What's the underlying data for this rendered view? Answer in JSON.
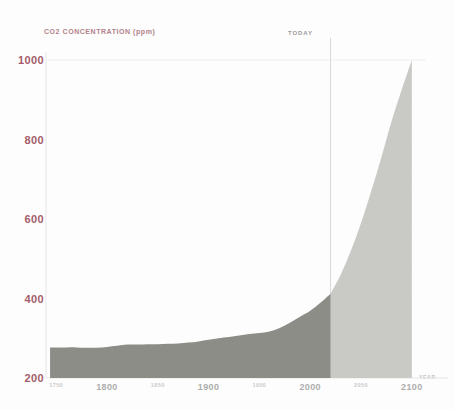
{
  "chart_data": {
    "type": "area",
    "title": "CO2 CONCENTRATION (ppm)",
    "xlabel": "YEAR",
    "ylabel": "CO2 CONCENTRATION (ppm)",
    "xlim": [
      1740,
      2110
    ],
    "ylim": [
      200,
      1000
    ],
    "yticks": [
      200,
      400,
      600,
      800,
      1000
    ],
    "xticks": [
      1750,
      1800,
      1850,
      1900,
      1950,
      2000,
      2050,
      2100
    ],
    "xtick_labels": [
      "1750",
      "1800",
      "1850",
      "1900",
      "1950",
      "2000",
      "2050",
      "2100"
    ],
    "xtick_emphasis": [
      "minor",
      "major",
      "minor",
      "major",
      "minor",
      "major",
      "minor",
      "major"
    ],
    "grid": false,
    "legend": null,
    "annotations": [
      {
        "text": "TODAY",
        "x": 2020,
        "type": "vertical-marker"
      }
    ],
    "series": [
      {
        "name": "Historical",
        "fill_color": "#8d8d88",
        "x": [
          1744,
          1750,
          1760,
          1770,
          1780,
          1790,
          1800,
          1810,
          1820,
          1830,
          1840,
          1850,
          1860,
          1870,
          1880,
          1890,
          1900,
          1910,
          1920,
          1930,
          1940,
          1950,
          1960,
          1970,
          1980,
          1990,
          2000,
          2010,
          2020
        ],
        "values": [
          277,
          277,
          277,
          277,
          276,
          276,
          278,
          281,
          284,
          284,
          285,
          285,
          286,
          287,
          289,
          292,
          296,
          300,
          303,
          307,
          311,
          313,
          317,
          326,
          339,
          354,
          369,
          389,
          412
        ]
      },
      {
        "name": "Projection",
        "fill_color": "#c9c9c6",
        "x": [
          2020,
          2030,
          2040,
          2050,
          2060,
          2070,
          2080,
          2090,
          2100
        ],
        "values": [
          412,
          460,
          520,
          590,
          670,
          755,
          845,
          925,
          1000
        ]
      }
    ],
    "baseline": 200,
    "today_year": 2020
  },
  "axis_style": {
    "tick_label_color": "#a45c6a",
    "axis_line_color": "#e6e6e6",
    "today_line_color": "#d8d8d8",
    "background": "#fdfdfd"
  }
}
